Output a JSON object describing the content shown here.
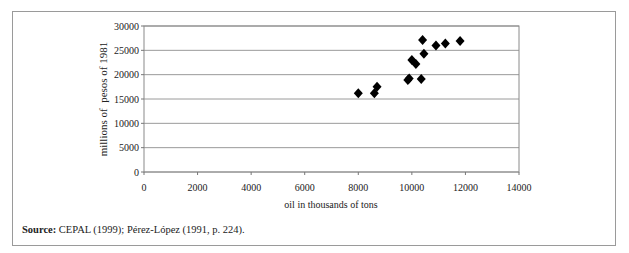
{
  "chart_data": {
    "type": "scatter",
    "title": "",
    "xlabel": "oil in thousands of tons",
    "ylabel": "millions of  pesos of 1981",
    "xlim": [
      0,
      14000
    ],
    "ylim": [
      0,
      30000
    ],
    "x_ticks": [
      "0",
      "2000",
      "4000",
      "6000",
      "8000",
      "10000",
      "12000",
      "14000"
    ],
    "y_ticks": [
      "0",
      "5000",
      "10000",
      "15000",
      "20000",
      "25000",
      "30000"
    ],
    "grid": {
      "horizontal": true,
      "vertical": false
    },
    "legend": null,
    "marker": "diamond",
    "marker_color": "#000000",
    "series": [
      {
        "name": "observations",
        "points": [
          {
            "x": 8000,
            "y": 16200
          },
          {
            "x": 8600,
            "y": 16200
          },
          {
            "x": 8700,
            "y": 17500
          },
          {
            "x": 9850,
            "y": 18900
          },
          {
            "x": 9900,
            "y": 19200
          },
          {
            "x": 10350,
            "y": 19100
          },
          {
            "x": 10000,
            "y": 23000
          },
          {
            "x": 10150,
            "y": 22200
          },
          {
            "x": 10450,
            "y": 24300
          },
          {
            "x": 10400,
            "y": 27100
          },
          {
            "x": 10900,
            "y": 26000
          },
          {
            "x": 11250,
            "y": 26400
          },
          {
            "x": 11800,
            "y": 26900
          }
        ]
      }
    ]
  },
  "source": {
    "label": "Source:",
    "text": " CEPAL (1999); Pérez-López (1991, p. 224)."
  }
}
